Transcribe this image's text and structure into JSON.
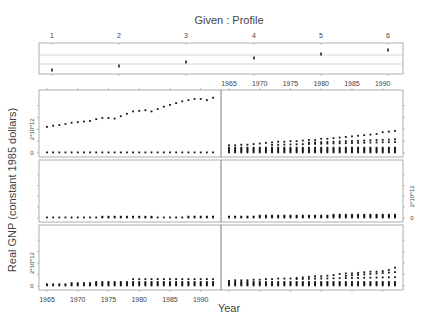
{
  "chart_data": {
    "type": "scatter",
    "subtype": "coplot",
    "title": "Given : Profile",
    "xlabel": "Year",
    "ylabel": "Real GNP (constant 1985 dollars)",
    "given": {
      "label": "Given : Profile",
      "ticks": [
        "1",
        "2",
        "3",
        "4",
        "5",
        "6"
      ],
      "intervals": [
        1,
        2,
        3,
        4,
        5,
        6
      ]
    },
    "x_ticks": [
      "1965",
      "1970",
      "1975",
      "1980",
      "1985",
      "1990"
    ],
    "xlim": [
      1964,
      1993
    ],
    "y_tick_labels": [
      "0",
      "2*10^12"
    ],
    "ylim": [
      0,
      5000000000000.0
    ],
    "layout": {
      "columns": 2,
      "rows": 3
    },
    "panels": [
      {
        "profile": 1,
        "position": "bottom-left",
        "description": "Clusters of points near 0 with slight rise; upper points reach ~0.6e12 by 1992"
      },
      {
        "profile": 2,
        "position": "bottom-right",
        "description": "Clusters near 0; top series rises to ~1.6e12 by 1992"
      },
      {
        "profile": 3,
        "position": "middle-left",
        "description": "All points near 0, slight rise"
      },
      {
        "profile": 4,
        "position": "middle-right",
        "description": "All points near 0, slight rise"
      },
      {
        "profile": 5,
        "position": "top-left",
        "description": "One series near 0; another rising from ~2.2e12 (1965) to ~4.8e12 (1992)"
      },
      {
        "profile": 6,
        "position": "top-right",
        "description": "Clusters near 0; top series rising from ~0.6e12 to ~1.9e12"
      }
    ],
    "series_top_left_upper": {
      "x": [
        1965,
        1966,
        1967,
        1968,
        1969,
        1970,
        1971,
        1972,
        1973,
        1974,
        1975,
        1976,
        1977,
        1978,
        1979,
        1980,
        1981,
        1982,
        1983,
        1984,
        1985,
        1986,
        1987,
        1988,
        1989,
        1990,
        1991,
        1992
      ],
      "y": [
        2.2,
        2.3,
        2.35,
        2.45,
        2.55,
        2.6,
        2.65,
        2.7,
        2.85,
        2.95,
        2.95,
        2.9,
        3.1,
        3.3,
        3.5,
        3.55,
        3.6,
        3.5,
        3.7,
        3.9,
        4.05,
        4.2,
        4.35,
        4.45,
        4.55,
        4.55,
        4.45,
        4.65
      ]
    },
    "series_top_right_upper": {
      "x": [
        1965,
        1966,
        1967,
        1968,
        1969,
        1970,
        1971,
        1972,
        1973,
        1974,
        1975,
        1976,
        1977,
        1978,
        1979,
        1980,
        1981,
        1982,
        1983,
        1984,
        1985,
        1986,
        1987,
        1988,
        1989,
        1990,
        1991,
        1992
      ],
      "y": [
        0.65,
        0.65,
        0.7,
        0.7,
        0.75,
        0.8,
        0.85,
        0.9,
        0.95,
        0.95,
        1.0,
        1.0,
        1.05,
        1.1,
        1.1,
        1.2,
        1.2,
        1.25,
        1.3,
        1.35,
        1.4,
        1.45,
        1.5,
        1.55,
        1.6,
        1.75,
        1.8,
        1.85
      ]
    },
    "series_bottom_right_upper": {
      "x": [
        1965,
        1966,
        1967,
        1968,
        1969,
        1970,
        1971,
        1972,
        1973,
        1974,
        1975,
        1976,
        1977,
        1978,
        1979,
        1980,
        1981,
        1982,
        1983,
        1984,
        1985,
        1986,
        1987,
        1988,
        1989,
        1990,
        1991,
        1992
      ],
      "y": [
        0.45,
        0.5,
        0.5,
        0.5,
        0.55,
        0.55,
        0.6,
        0.6,
        0.65,
        0.65,
        0.65,
        0.7,
        0.75,
        0.8,
        0.85,
        0.85,
        0.9,
        0.95,
        1.05,
        1.1,
        1.1,
        1.15,
        1.2,
        1.25,
        1.25,
        1.3,
        1.4,
        1.6
      ]
    }
  }
}
